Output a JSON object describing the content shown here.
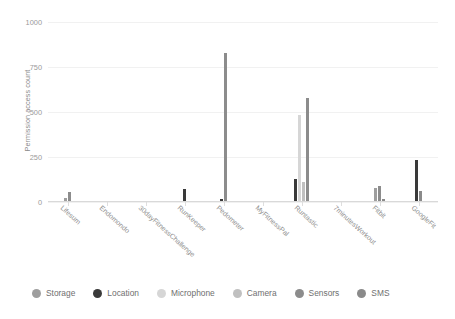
{
  "chart_data": {
    "type": "bar",
    "title": "",
    "xlabel": "",
    "ylabel": "Permission access count",
    "ylim": [
      0,
      1000
    ],
    "yticks": [
      0,
      250,
      500,
      750,
      1000
    ],
    "grid": true,
    "legend_position": "bottom",
    "categories": [
      "Lifesum",
      "Endomondo",
      "30dayFitnessChallenge",
      "RunKeeper",
      "Pedometer",
      "MyFitnessPal",
      "Runtastic",
      "7minutesWorkout",
      "Fitbit",
      "GoogleFit"
    ],
    "series": [
      {
        "name": "Storage",
        "color": "#9e9e9e",
        "values": [
          22,
          0,
          0,
          0,
          0,
          0,
          0,
          0,
          80,
          0
        ]
      },
      {
        "name": "Location",
        "color": "#3a3a3a",
        "values": [
          0,
          6,
          0,
          70,
          15,
          0,
          130,
          0,
          0,
          235
        ]
      },
      {
        "name": "Microphone",
        "color": "#d6d6d6",
        "values": [
          0,
          0,
          0,
          0,
          0,
          0,
          485,
          0,
          0,
          0
        ]
      },
      {
        "name": "Camera",
        "color": "#c0c0c0",
        "values": [
          0,
          0,
          0,
          0,
          0,
          0,
          112,
          0,
          0,
          0
        ]
      },
      {
        "name": "Sensors",
        "color": "#8c8c8c",
        "values": [
          58,
          0,
          8,
          0,
          830,
          0,
          580,
          0,
          90,
          0
        ]
      },
      {
        "name": "SMS",
        "color": "#8a8a8a",
        "values": [
          0,
          0,
          0,
          0,
          0,
          0,
          0,
          0,
          18,
          62
        ]
      }
    ]
  },
  "legend": {
    "items": [
      {
        "label": "Storage",
        "color": "#9e9e9e"
      },
      {
        "label": "Location",
        "color": "#3a3a3a"
      },
      {
        "label": "Microphone",
        "color": "#d6d6d6"
      },
      {
        "label": "Camera",
        "color": "#c0c0c0"
      },
      {
        "label": "Sensors",
        "color": "#8c8c8c"
      },
      {
        "label": "SMS",
        "color": "#8a8a8a"
      }
    ]
  }
}
